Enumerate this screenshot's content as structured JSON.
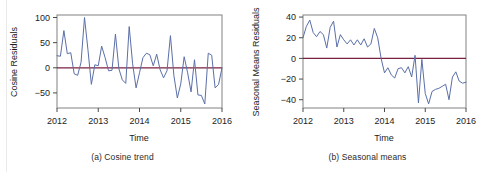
{
  "figure": {
    "background": "#ffffff",
    "line_color": "#5b6fa8",
    "zero_line_color": "#7a2040",
    "frame_color": "#8c8c8c",
    "tick_color": "#4a4a4a"
  },
  "chart_data": [
    {
      "type": "line",
      "panel_label": "(a)",
      "caption": "(a) Cosine trend",
      "title": "",
      "xlabel": "Time",
      "ylabel": "Cosine Residuals",
      "xlim": [
        2012,
        2016
      ],
      "ylim": [
        -80,
        105
      ],
      "xticks": [
        2012,
        2013,
        2014,
        2015,
        2016
      ],
      "xtick_labels": [
        "2012",
        "2013",
        "2014",
        "2015",
        "2016"
      ],
      "yticks": [
        -50,
        0,
        50,
        100
      ],
      "ytick_labels": [
        "−50",
        "0",
        "50",
        "100"
      ],
      "grid": false,
      "legend": "none",
      "reference_line": 0,
      "series": [
        {
          "name": "Cosine Residuals",
          "x": [
            2012.0,
            2012.083,
            2012.167,
            2012.25,
            2012.333,
            2012.417,
            2012.5,
            2012.583,
            2012.667,
            2012.75,
            2012.833,
            2012.917,
            2013.0,
            2013.083,
            2013.167,
            2013.25,
            2013.333,
            2013.417,
            2013.5,
            2013.583,
            2013.667,
            2013.75,
            2013.833,
            2013.917,
            2014.0,
            2014.083,
            2014.167,
            2014.25,
            2014.333,
            2014.417,
            2014.5,
            2014.583,
            2014.667,
            2014.75,
            2014.833,
            2014.917,
            2015.0,
            2015.083,
            2015.167,
            2015.25,
            2015.333,
            2015.417,
            2015.5,
            2015.583,
            2015.667,
            2015.75,
            2015.833,
            2015.917,
            2016.0
          ],
          "values": [
            24,
            23,
            74,
            28,
            30,
            -12,
            -15,
            11,
            100,
            36,
            -33,
            6,
            4,
            43,
            20,
            -6,
            -5,
            67,
            -2,
            -24,
            -31,
            82,
            8,
            -40,
            -10,
            20,
            29,
            26,
            4,
            27,
            -4,
            -20,
            -6,
            64,
            -15,
            -60,
            -32,
            22,
            -10,
            -48,
            16,
            -54,
            -55,
            -72,
            29,
            25,
            -40,
            -33,
            0
          ]
        }
      ]
    },
    {
      "type": "line",
      "panel_label": "(b)",
      "caption": "(b) Seasonal means",
      "title": "",
      "xlabel": "Time",
      "ylabel": "Seasonal Means Residuals",
      "xlim": [
        2012,
        2016
      ],
      "ylim": [
        -48,
        42
      ],
      "xticks": [
        2012,
        2013,
        2014,
        2015,
        2016
      ],
      "xtick_labels": [
        "2012",
        "2013",
        "2014",
        "2015",
        "2016"
      ],
      "yticks": [
        -40,
        -20,
        0,
        20,
        40
      ],
      "ytick_labels": [
        "−40",
        "−20",
        "0",
        "20",
        "40"
      ],
      "grid": false,
      "legend": "none",
      "reference_line": 0,
      "series": [
        {
          "name": "Seasonal Means Residuals",
          "x": [
            2012.0,
            2012.083,
            2012.167,
            2012.25,
            2012.333,
            2012.417,
            2012.5,
            2012.583,
            2012.667,
            2012.75,
            2012.833,
            2012.917,
            2013.0,
            2013.083,
            2013.167,
            2013.25,
            2013.333,
            2013.417,
            2013.5,
            2013.583,
            2013.667,
            2013.75,
            2013.833,
            2013.917,
            2014.0,
            2014.083,
            2014.167,
            2014.25,
            2014.333,
            2014.417,
            2014.5,
            2014.583,
            2014.667,
            2014.75,
            2014.833,
            2014.917,
            2015.0,
            2015.083,
            2015.167,
            2015.25,
            2015.333,
            2015.417,
            2015.5,
            2015.583,
            2015.667,
            2015.75,
            2015.833,
            2015.917,
            2016.0
          ],
          "values": [
            20,
            31,
            37,
            25,
            21,
            26,
            23,
            10,
            30,
            36,
            11,
            23,
            18,
            14,
            18,
            13,
            18,
            13,
            19,
            11,
            14,
            29,
            20,
            0,
            -14,
            -9,
            -16,
            -19,
            -10,
            -9,
            -14,
            -8,
            -18,
            3,
            -43,
            -1,
            -34,
            -44,
            -32,
            -30,
            -29,
            -27,
            -25,
            -40,
            -18,
            -13,
            -22,
            -24,
            -23
          ]
        }
      ]
    }
  ]
}
